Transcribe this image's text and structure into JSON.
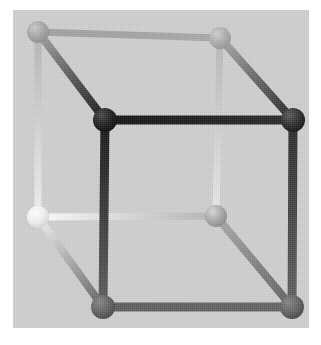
{
  "figure": {
    "background_color": "#ffffff",
    "panel_color": "#cfcfcf",
    "panel": {
      "x": 13,
      "y": 10,
      "width": 296,
      "height": 318
    }
  },
  "geometry": {
    "type": "cube",
    "projection": "oblique",
    "vertex_count": 8,
    "edge_count": 12,
    "vertices": [
      {
        "id": "back-top-left",
        "label": "BTL",
        "cx": 25,
        "cy": 22,
        "r": 11,
        "color": "#a5a5a5",
        "highlight": "#c9c9c9",
        "shadow": "#8a8a8a"
      },
      {
        "id": "back-top-right",
        "label": "BTR",
        "cx": 207,
        "cy": 28,
        "r": 11,
        "color": "#adadad",
        "highlight": "#cfcfcf",
        "shadow": "#929292"
      },
      {
        "id": "back-bottom-left",
        "label": "BBL",
        "cx": 25,
        "cy": 207,
        "r": 11,
        "color": "#f2f2f2",
        "highlight": "#ffffff",
        "shadow": "#d2d2d2"
      },
      {
        "id": "back-bottom-right",
        "label": "BBR",
        "cx": 203,
        "cy": 206,
        "r": 11,
        "color": "#a8a8a8",
        "highlight": "#d8d8d8",
        "shadow": "#888888"
      },
      {
        "id": "front-top-left",
        "label": "FTL",
        "cx": 92,
        "cy": 110,
        "r": 12,
        "color": "#202020",
        "highlight": "#4a4a4a",
        "shadow": "#080808"
      },
      {
        "id": "front-top-right",
        "label": "FTR",
        "cx": 280,
        "cy": 110,
        "r": 12,
        "color": "#2e2e2e",
        "highlight": "#5c5c5c",
        "shadow": "#101010"
      },
      {
        "id": "front-bottom-left",
        "label": "FBL",
        "cx": 90,
        "cy": 297,
        "r": 12,
        "color": "#636363",
        "highlight": "#868686",
        "shadow": "#464646"
      },
      {
        "id": "front-bottom-right",
        "label": "FBR",
        "cx": 279,
        "cy": 297,
        "r": 12,
        "color": "#636363",
        "highlight": "#868686",
        "shadow": "#464646"
      }
    ],
    "edges": [
      {
        "id": "edge-back-top",
        "from": "back-top-left",
        "to": "back-top-right",
        "width": 7,
        "color_from": "#a0a0a0",
        "color_to": "#a8a8a8"
      },
      {
        "id": "edge-back-left-vertical",
        "from": "back-top-left",
        "to": "back-bottom-left",
        "width": 7,
        "color_from": "#b4b4b4",
        "color_to": "#f0f0f0"
      },
      {
        "id": "edge-back-bottom",
        "from": "back-bottom-left",
        "to": "back-bottom-right",
        "width": 7,
        "color_from": "#fdfdfd",
        "color_to": "#b4b4b4"
      },
      {
        "id": "edge-back-right-vertical",
        "from": "back-top-right",
        "to": "back-bottom-right",
        "width": 7,
        "color_from": "#b8b8b8",
        "color_to": "#e8e8e8"
      },
      {
        "id": "edge-front-top",
        "from": "front-top-left",
        "to": "front-top-right",
        "width": 9,
        "color_from": "#131313",
        "color_to": "#2a2a2a"
      },
      {
        "id": "edge-front-left-vertical",
        "from": "front-top-left",
        "to": "front-bottom-left",
        "width": 9,
        "color_from": "#161616",
        "color_to": "#5e5e5e"
      },
      {
        "id": "edge-front-bottom",
        "from": "front-bottom-left",
        "to": "front-bottom-right",
        "width": 9,
        "color_from": "#5e5e5e",
        "color_to": "#646464"
      },
      {
        "id": "edge-front-right-vertical",
        "from": "front-top-right",
        "to": "front-bottom-right",
        "width": 9,
        "color_from": "#2a2a2a",
        "color_to": "#616161"
      },
      {
        "id": "edge-depth-top-left",
        "from": "back-top-left",
        "to": "front-top-left",
        "width": 8,
        "color_from": "#a3a3a3",
        "color_to": "#151515"
      },
      {
        "id": "edge-depth-top-right",
        "from": "back-top-right",
        "to": "front-top-right",
        "width": 8,
        "color_from": "#ababab",
        "color_to": "#242424"
      },
      {
        "id": "edge-depth-bottom-left",
        "from": "back-bottom-left",
        "to": "front-bottom-left",
        "width": 8,
        "color_from": "#f4f4f4",
        "color_to": "#5f5f5f"
      },
      {
        "id": "edge-depth-bottom-right",
        "from": "back-bottom-right",
        "to": "front-bottom-right",
        "width": 8,
        "color_from": "#ababab",
        "color_to": "#606060"
      }
    ]
  }
}
